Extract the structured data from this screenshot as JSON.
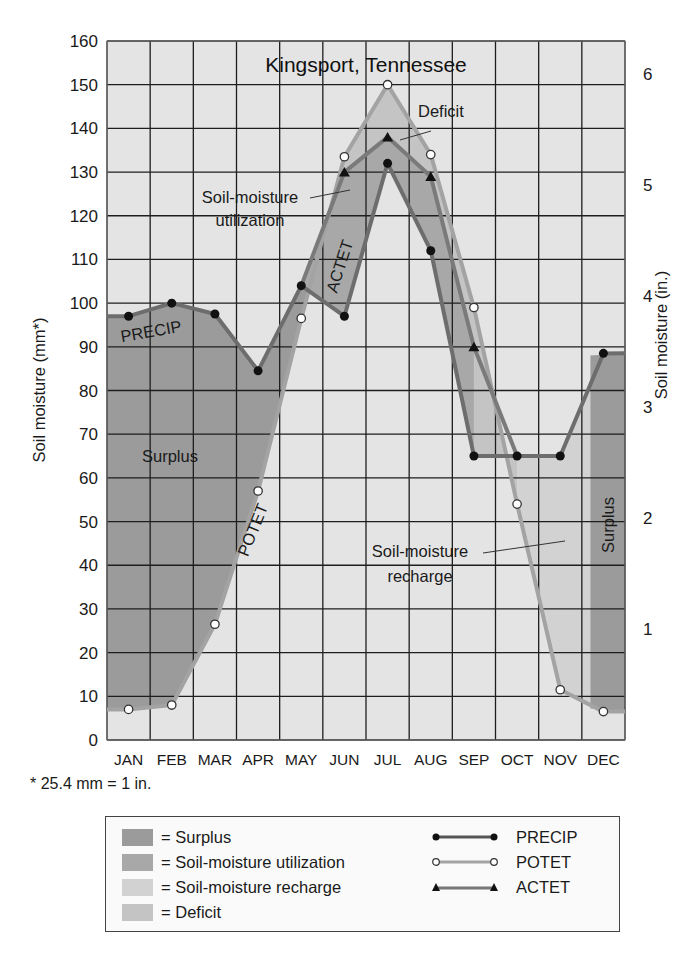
{
  "chart_data": {
    "type": "line",
    "title": "Kingsport, Tennessee",
    "xlabel": "",
    "ylabel": "Soil moisture (mm*)",
    "ylabel_right": "Soil moisture (in.)",
    "ylim": [
      0,
      160
    ],
    "ylim_right": [
      0,
      6.3
    ],
    "y_ticks": [
      0,
      10,
      20,
      30,
      40,
      50,
      60,
      70,
      80,
      90,
      100,
      110,
      120,
      130,
      140,
      150,
      160
    ],
    "y_ticks_right": [
      1,
      2,
      3,
      4,
      5,
      6
    ],
    "grid": true,
    "categories": [
      "JAN",
      "FEB",
      "MAR",
      "APR",
      "MAY",
      "JUN",
      "JUL",
      "AUG",
      "SEP",
      "OCT",
      "NOV",
      "DEC"
    ],
    "series": [
      {
        "name": "PRECIP",
        "marker": "filled-circle",
        "values": [
          97,
          100,
          97.5,
          84.5,
          104,
          97,
          132,
          112,
          65,
          65,
          65,
          88.5
        ]
      },
      {
        "name": "POTET",
        "marker": "open-circle",
        "values": [
          7,
          8,
          26.5,
          57,
          96.5,
          133.5,
          150,
          134,
          99,
          54,
          11.5,
          6.5
        ]
      },
      {
        "name": "ACTET",
        "marker": "triangle",
        "values": [
          null,
          null,
          null,
          null,
          null,
          130,
          138,
          129,
          90,
          null,
          null,
          null
        ]
      }
    ],
    "areas": [
      {
        "name": "Surplus",
        "color": "#9b9b9b"
      },
      {
        "name": "Soil-moisture utilization",
        "color": "#a8a8a8"
      },
      {
        "name": "Soil-moisture recharge",
        "color": "#d2d2d2"
      },
      {
        "name": "Deficit",
        "color": "#c4c4c4"
      }
    ],
    "annotations": [
      "Deficit",
      "Soil-moisture utilization",
      "ACTET",
      "PRECIP",
      "Surplus",
      "POTET",
      "Soil-moisture recharge",
      "Surplus"
    ],
    "footnote": "* 25.4 mm = 1 in.",
    "legend_position": "bottom"
  },
  "labels": {
    "title": "Kingsport, Tennessee",
    "ylabel": "Soil moisture (mm*)",
    "ylabel_right": "Soil moisture (in.)",
    "footnote": "* 25.4 mm = 1 in.",
    "anno_deficit": "Deficit",
    "anno_util_1": "Soil-moisture",
    "anno_util_2": "utilization",
    "anno_actet": "ACTET",
    "anno_precip": "PRECIP",
    "anno_surplus": "Surplus",
    "anno_potet": "POTET",
    "anno_recharge_1": "Soil-moisture",
    "anno_recharge_2": "recharge",
    "anno_surplus_dec": "Surplus"
  },
  "legend": {
    "areas": [
      {
        "label": "= Surplus",
        "color": "#9b9b9b"
      },
      {
        "label": "= Soil-moisture utilization",
        "color": "#a8a8a8"
      },
      {
        "label": "= Soil-moisture recharge",
        "color": "#d2d2d2"
      },
      {
        "label": "= Deficit",
        "color": "#c4c4c4"
      }
    ],
    "lines": [
      {
        "label": "PRECIP"
      },
      {
        "label": "POTET"
      },
      {
        "label": "ACTET"
      }
    ]
  },
  "colors": {
    "background": "#e4e4e4",
    "grid": "#1e1e1e",
    "precip_line": "#6d6d6d",
    "potet_line": "#a3a3a3",
    "actet_line": "#7a7a7a"
  }
}
